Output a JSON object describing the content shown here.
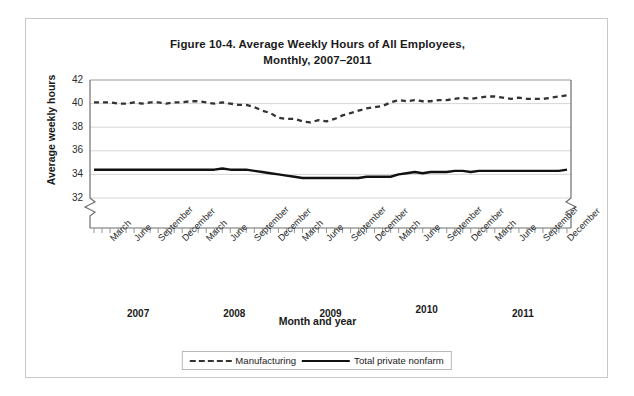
{
  "chart_data": {
    "type": "line",
    "title": "Figure 10-4. Average Weekly Hours of All Employees, Monthly, 2007–2011",
    "title_line1": "Figure 10-4. Average Weekly Hours of All Employees,",
    "title_line2": "Monthly, 2007–2011",
    "xlabel": "Month and year",
    "ylabel": "Average weekly hours",
    "ylim": [
      32,
      42
    ],
    "y_ticks": [
      42,
      40,
      38,
      36,
      34,
      32
    ],
    "y_axis_break": true,
    "grid": "horizontal",
    "legend_position": "bottom-center",
    "x_tick_labels": [
      "March",
      "June",
      "September",
      "December",
      "March",
      "June",
      "September",
      "December",
      "March",
      "June",
      "September",
      "December",
      "March",
      "June",
      "September",
      "December",
      "March",
      "June",
      "September",
      "December"
    ],
    "year_labels": [
      "2007",
      "2008",
      "2009",
      "2010",
      "2011"
    ],
    "x_months": [
      "2007-01",
      "2007-02",
      "2007-03",
      "2007-04",
      "2007-05",
      "2007-06",
      "2007-07",
      "2007-08",
      "2007-09",
      "2007-10",
      "2007-11",
      "2007-12",
      "2008-01",
      "2008-02",
      "2008-03",
      "2008-04",
      "2008-05",
      "2008-06",
      "2008-07",
      "2008-08",
      "2008-09",
      "2008-10",
      "2008-11",
      "2008-12",
      "2009-01",
      "2009-02",
      "2009-03",
      "2009-04",
      "2009-05",
      "2009-06",
      "2009-07",
      "2009-08",
      "2009-09",
      "2009-10",
      "2009-11",
      "2009-12",
      "2010-01",
      "2010-02",
      "2010-03",
      "2010-04",
      "2010-05",
      "2010-06",
      "2010-07",
      "2010-08",
      "2010-09",
      "2010-10",
      "2010-11",
      "2010-12",
      "2011-01",
      "2011-02",
      "2011-03",
      "2011-04",
      "2011-05",
      "2011-06",
      "2011-07",
      "2011-08",
      "2011-09",
      "2011-10",
      "2011-11",
      "2011-12"
    ],
    "series": [
      {
        "name": "Manufacturing",
        "style": "dashed",
        "color": "#333333",
        "values": [
          40.1,
          40.1,
          40.1,
          40.0,
          40.0,
          40.1,
          40.0,
          40.1,
          40.1,
          40.0,
          40.1,
          40.1,
          40.2,
          40.2,
          40.1,
          40.0,
          40.1,
          40.0,
          39.9,
          39.9,
          39.7,
          39.4,
          39.2,
          38.8,
          38.7,
          38.7,
          38.5,
          38.4,
          38.6,
          38.5,
          38.7,
          39.0,
          39.2,
          39.4,
          39.6,
          39.7,
          39.8,
          40.1,
          40.3,
          40.2,
          40.3,
          40.2,
          40.2,
          40.3,
          40.3,
          40.4,
          40.5,
          40.4,
          40.5,
          40.6,
          40.6,
          40.5,
          40.4,
          40.5,
          40.4,
          40.4,
          40.4,
          40.5,
          40.6,
          40.7
        ]
      },
      {
        "name": "Total private nonfarm",
        "style": "solid",
        "color": "#111111",
        "values": [
          34.4,
          34.4,
          34.4,
          34.4,
          34.4,
          34.4,
          34.4,
          34.4,
          34.4,
          34.4,
          34.4,
          34.4,
          34.4,
          34.4,
          34.4,
          34.4,
          34.5,
          34.4,
          34.4,
          34.4,
          34.3,
          34.2,
          34.1,
          34.0,
          33.9,
          33.8,
          33.7,
          33.7,
          33.7,
          33.7,
          33.7,
          33.7,
          33.7,
          33.7,
          33.8,
          33.8,
          33.8,
          33.8,
          34.0,
          34.1,
          34.2,
          34.1,
          34.2,
          34.2,
          34.2,
          34.3,
          34.3,
          34.2,
          34.3,
          34.3,
          34.3,
          34.3,
          34.3,
          34.3,
          34.3,
          34.3,
          34.3,
          34.3,
          34.3,
          34.4
        ]
      }
    ],
    "legend": [
      {
        "label": "Manufacturing",
        "style": "dashed"
      },
      {
        "label": "Total private nonfarm",
        "style": "solid"
      }
    ]
  }
}
